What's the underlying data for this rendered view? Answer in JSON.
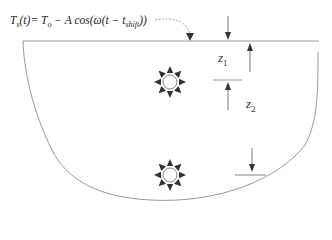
{
  "formula": {
    "lhs": "T",
    "lhs_sub": "s",
    "lhs_arg": "(t)",
    "eq": "= ",
    "t0": "T",
    "t0_sub": "o",
    "rest1": " − A cos(ω(t − t",
    "shift_sub": "shift",
    "rest2": "))"
  },
  "labels": {
    "z1": "z",
    "z1_sub": "1",
    "z2": "z",
    "z2_sub": "2"
  },
  "sources": [
    {
      "name": "heat-source-upper"
    },
    {
      "name": "heat-source-lower"
    }
  ],
  "colors": {
    "line": "#9a9a9a",
    "arrow": "#333333",
    "source": "#333333"
  }
}
